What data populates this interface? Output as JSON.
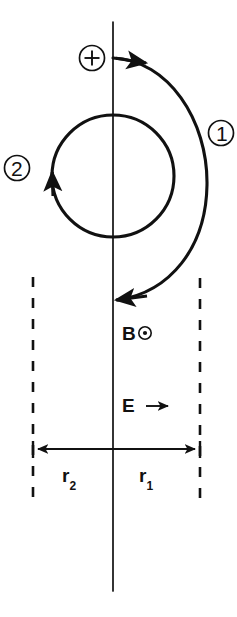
{
  "figure": {
    "background_color": "#ffffff",
    "ink_color": "#111111",
    "width": 237,
    "height": 617,
    "labels": {
      "charge_symbol": "⊕",
      "trajectory_one": "①",
      "trajectory_two": "②",
      "magnetic_field": "B",
      "magnetic_field_direction_glyph": "⊙",
      "electric_field": "E",
      "electric_field_direction_glyph": "→",
      "radius_two": "r",
      "radius_two_subscript": "2",
      "radius_one": "r",
      "radius_one_subscript": "1"
    },
    "geometry": {
      "axis_x": 113,
      "axis_y_top": 22,
      "axis_y_bottom": 591,
      "circle_two_center_x": 113,
      "circle_two_center_y": 176,
      "circle_two_radius": 61,
      "arc_one_start_y": 58,
      "arc_one_end_y": 300,
      "arc_one_bulge_x": 203,
      "dash_left_x": 33,
      "dash_right_x": 200,
      "dash_y_top": 277,
      "dash_y_bottom": 501,
      "dimension_line_y": 449
    }
  }
}
